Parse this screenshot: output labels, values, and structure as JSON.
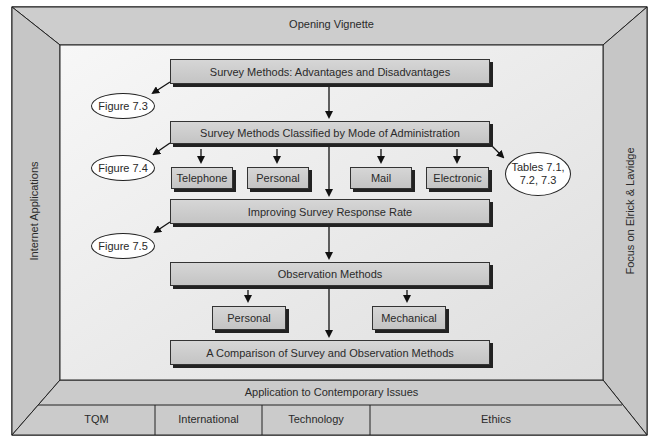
{
  "frame": {
    "top_band": "Opening Vignette",
    "left_band": "Internet Applications",
    "right_band": "Focus on Elrick & Lavidge",
    "bottom_band": "Application to Contemporary Issues",
    "bottom_tabs": [
      "TQM",
      "International",
      "Technology",
      "Ethics"
    ],
    "colors": {
      "band": "#c9c9c9",
      "inner": "#ececec",
      "line": "#222222"
    }
  },
  "flow": {
    "boxes": [
      "Survey Methods: Advantages and Disadvantages",
      "Survey Methods Classified by Mode of Administration",
      "Improving Survey Response Rate",
      "Observation Methods",
      "A Comparison of Survey and Observation Methods"
    ],
    "survey_modes": [
      "Telephone",
      "Personal",
      "Mail",
      "Electronic"
    ],
    "observation_modes": [
      "Personal",
      "Mechanical"
    ]
  },
  "references": {
    "fig_7_3": "Figure 7.3",
    "fig_7_4": "Figure 7.4",
    "fig_7_5": "Figure 7.5",
    "tables_line1": "Tables 7.1,",
    "tables_line2": "7.2, 7.3"
  }
}
